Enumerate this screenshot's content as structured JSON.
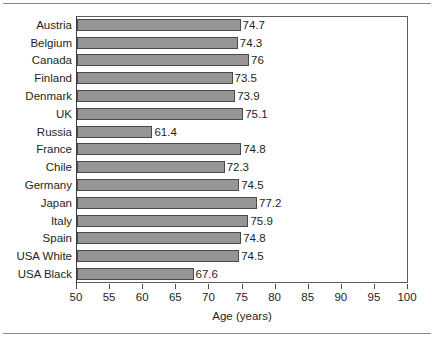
{
  "chart_data": {
    "type": "bar",
    "orientation": "horizontal",
    "title": "",
    "xlabel": "Age (years)",
    "ylabel": "",
    "xlim": [
      50,
      100
    ],
    "xticks": [
      50,
      55,
      60,
      65,
      70,
      75,
      80,
      85,
      90,
      95,
      100
    ],
    "grid": false,
    "legend": false,
    "categories": [
      "Austria",
      "Belgium",
      "Canada",
      "Finland",
      "Denmark",
      "UK",
      "Russia",
      "France",
      "Chile",
      "Germany",
      "Japan",
      "Italy",
      "Spain",
      "USA White",
      "USA Black"
    ],
    "values": [
      74.7,
      74.3,
      76,
      73.5,
      73.9,
      75.1,
      61.4,
      74.8,
      72.3,
      74.5,
      77.2,
      75.9,
      74.8,
      74.5,
      67.6
    ],
    "value_labels": [
      "74.7",
      "74.3",
      "76",
      "73.5",
      "73.9",
      "75.1",
      "61.4",
      "74.8",
      "72.3",
      "74.5",
      "77.2",
      "75.9",
      "74.8",
      "74.5",
      "67.6"
    ],
    "bar_color": "#969696",
    "bar_edge_color": "#4a4a4a",
    "text_color": "#231f20",
    "axis_color": "#5d5d5d",
    "background": "#ffffff"
  }
}
